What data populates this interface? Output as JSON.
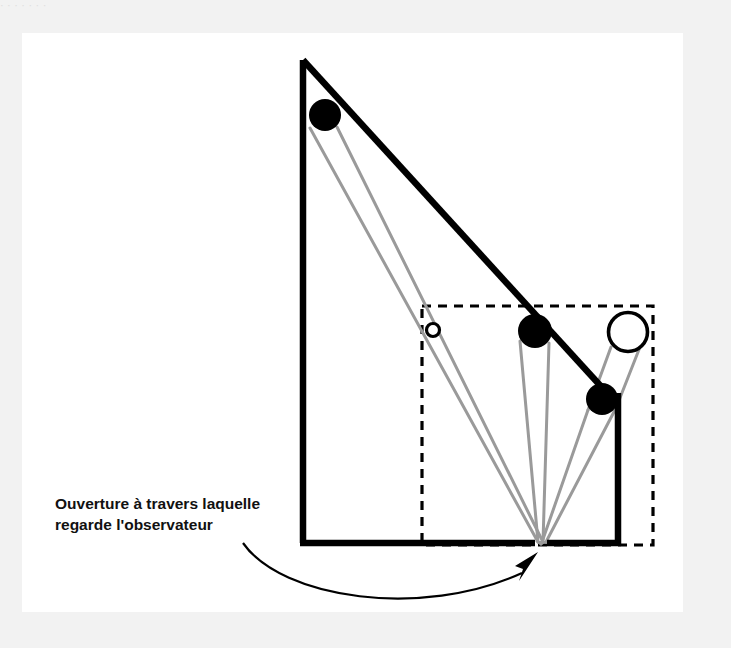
{
  "page": {
    "background_color": "#f2f2f2",
    "panel_color": "#ffffff",
    "top_sliver_text": "·   ·                 ·                                   ·                      ·        ·            ·"
  },
  "figure": {
    "title": "Ouverture à travers laquelle regarde l'observateur",
    "caption_line_1": "Ouverture à travers laquelle",
    "caption_line_2": "regarde l'observateur",
    "colors": {
      "outline": "#000000",
      "ray": "#9a9a9a",
      "dashed": "#000000",
      "object_fill": "#000000",
      "hollow_fill": "#ffffff",
      "caption": "#111111"
    },
    "geometry": {
      "apex": {
        "x": 281,
        "y": 27
      },
      "bottom_left": {
        "x": 281,
        "y": 510
      },
      "bottom_right": {
        "x": 596,
        "y": 510
      },
      "aperture": {
        "x": 519,
        "y": 509
      },
      "dashed_rect": {
        "x": 400,
        "y": 273,
        "width": 231,
        "height": 239
      }
    },
    "objects": [
      {
        "name": "far-object-large",
        "style": "filled",
        "cx": 303,
        "cy": 82,
        "r": 16
      },
      {
        "name": "image-point-small",
        "style": "hollow",
        "cx": 411,
        "cy": 297,
        "r": 7
      },
      {
        "name": "near-object-middle",
        "style": "filled",
        "cx": 513,
        "cy": 298,
        "r": 17
      },
      {
        "name": "projected-image-large",
        "style": "hollow",
        "cx": 606,
        "cy": 299,
        "r": 20
      },
      {
        "name": "near-object-lower",
        "style": "filled",
        "cx": 580,
        "cy": 366,
        "r": 16
      }
    ],
    "rays": [
      {
        "from": "far-object-large",
        "side": "left"
      },
      {
        "from": "far-object-large",
        "side": "right"
      },
      {
        "from": "near-object-middle",
        "side": "left"
      },
      {
        "from": "near-object-middle",
        "side": "right"
      },
      {
        "from": "near-object-lower",
        "side": "left"
      },
      {
        "from": "near-object-lower",
        "side": "right"
      }
    ],
    "annotation": {
      "arrow_start": {
        "x": 221,
        "y": 510
      },
      "arrow_tip": {
        "x": 516,
        "y": 520
      }
    }
  }
}
